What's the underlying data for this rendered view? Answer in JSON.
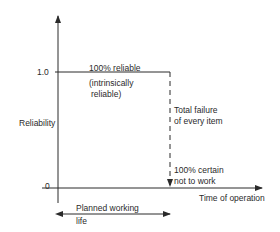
{
  "diagram": {
    "y_axis": {
      "label": "Reliability",
      "ticks": [
        "1.0",
        "0"
      ]
    },
    "x_axis": {
      "label": "Time of operation"
    },
    "annotations": {
      "reliable_top": "100% reliable",
      "reliable_sub1": "(intrinsically",
      "reliable_sub2": "reliable)",
      "failure1": "Total failure",
      "failure2": "of every item",
      "certain1": "100% certain",
      "certain2": "not to work",
      "life1": "Planned working",
      "life2": "life"
    },
    "colors": {
      "line": "#2a2a2a",
      "background": "#ffffff"
    }
  }
}
